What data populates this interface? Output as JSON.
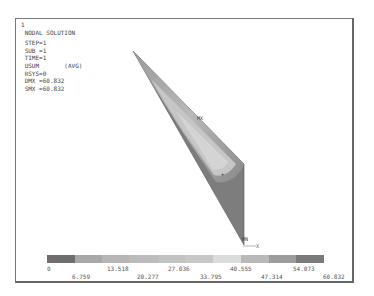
{
  "plot": {
    "window_number": "1",
    "title": "NODAL SOLUTION",
    "step": "STEP=1",
    "sub": "SUB =1",
    "time": "TIME=1",
    "quantity": "USUM       (AVG)",
    "rsys": "RSYS=0",
    "dmx": "DMX =60.832",
    "smx": "SMX =60.832",
    "markers": {
      "mx": "MX",
      "mn": "MN",
      "axis_x": "X"
    }
  },
  "legend": {
    "colors": [
      "#6e6e6e",
      "#a8a8a8",
      "#b6b6b6",
      "#bcbcbc",
      "#c2c2c2",
      "#c8c8c8",
      "#d2d2d2",
      "#dcdcdc",
      "#b0b0b0",
      "#7a7a7a"
    ],
    "upper_ticks": [
      "0",
      "13.518",
      "27.036",
      "40.555",
      "54.073"
    ],
    "lower_ticks": [
      "6.759",
      "20.277",
      "33.795",
      "47.314",
      "60.832"
    ]
  }
}
